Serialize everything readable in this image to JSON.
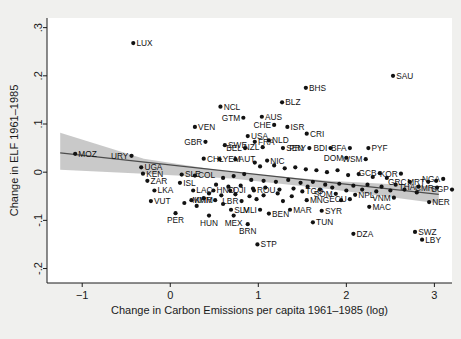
{
  "chart_data": {
    "type": "scatter",
    "title": "",
    "xlabel": "Change in Carbon Emissions per capita 1961–1985 (log)",
    "ylabel": "Change in ELF 1961–1985",
    "xlim": [
      -1.4,
      3.2
    ],
    "ylim": [
      -0.23,
      0.32
    ],
    "xticks": [
      -1,
      0,
      1,
      2,
      3
    ],
    "xticklabels": [
      "−1",
      "0",
      "1",
      "2",
      "3"
    ],
    "yticks": [
      -0.2,
      -0.1,
      0,
      0.1,
      0.2,
      0.3
    ],
    "yticklabels": [
      "-.2",
      "-.1",
      "0",
      ".1",
      ".2",
      ".3"
    ],
    "grid": false,
    "legend": null,
    "marker_color": "#121212",
    "fit_line_color": "#4d4d4d",
    "ci_band_color": "#bfbfbf",
    "fit_line": {
      "x0": -1.25,
      "y0": 0.04,
      "x1": 3.05,
      "y1": -0.046
    },
    "ci_band": {
      "upper": [
        [
          -1.25,
          0.082
        ],
        [
          -0.3,
          0.028
        ],
        [
          0.7,
          0.0
        ],
        [
          1.8,
          -0.018
        ],
        [
          3.05,
          -0.03
        ]
      ],
      "lower": [
        [
          -1.25,
          0.005
        ],
        [
          -0.3,
          -0.003
        ],
        [
          0.7,
          -0.013
        ],
        [
          1.8,
          -0.035
        ],
        [
          3.05,
          -0.065
        ]
      ]
    },
    "points": [
      {
        "label": "LUX",
        "x": -0.42,
        "y": 0.268,
        "lp": "right"
      },
      {
        "label": "SAU",
        "x": 2.53,
        "y": 0.2,
        "lp": "right"
      },
      {
        "label": "BHS",
        "x": 1.54,
        "y": 0.175,
        "lp": "right"
      },
      {
        "label": "BLZ",
        "x": 1.27,
        "y": 0.145,
        "lp": "right"
      },
      {
        "label": "NCL",
        "x": 0.57,
        "y": 0.136,
        "lp": "right"
      },
      {
        "label": "AUS",
        "x": 1.04,
        "y": 0.115,
        "lp": "right"
      },
      {
        "label": "GTM",
        "x": 0.83,
        "y": 0.113,
        "lp": "left"
      },
      {
        "label": "CHE",
        "x": 1.18,
        "y": 0.098,
        "lp": "left"
      },
      {
        "label": "ISR",
        "x": 1.33,
        "y": 0.094,
        "lp": "right"
      },
      {
        "label": "VEN",
        "x": 0.28,
        "y": 0.094,
        "lp": "right"
      },
      {
        "label": "CRI",
        "x": 1.55,
        "y": 0.08,
        "lp": "right"
      },
      {
        "label": "USA",
        "x": 0.88,
        "y": 0.075,
        "lp": "right"
      },
      {
        "label": "NLD",
        "x": 1.12,
        "y": 0.066,
        "lp": "right"
      },
      {
        "label": "GBR",
        "x": 0.4,
        "y": 0.063,
        "lp": "left"
      },
      {
        "label": "FRA",
        "x": 0.96,
        "y": 0.063,
        "lp": "right"
      },
      {
        "label": "SWE",
        "x": 0.62,
        "y": 0.056,
        "lp": "right"
      },
      {
        "label": "BEL",
        "x": 0.85,
        "y": 0.05,
        "lp": "left"
      },
      {
        "label": "NZL",
        "x": 1.05,
        "y": 0.052,
        "lp": "left"
      },
      {
        "label": "SEN",
        "x": 1.28,
        "y": 0.05,
        "lp": "right"
      },
      {
        "label": "PRY",
        "x": 1.58,
        "y": 0.05,
        "lp": "left"
      },
      {
        "label": "BDI",
        "x": 1.82,
        "y": 0.05,
        "lp": "left"
      },
      {
        "label": "BFA",
        "x": 2.04,
        "y": 0.05,
        "lp": "left"
      },
      {
        "label": "PYF",
        "x": 2.25,
        "y": 0.05,
        "lp": "right"
      },
      {
        "label": "MOZ",
        "x": -1.08,
        "y": 0.038,
        "lp": "right"
      },
      {
        "label": "URY",
        "x": -0.44,
        "y": 0.034,
        "lp": "left"
      },
      {
        "label": "CHL",
        "x": 0.38,
        "y": 0.028,
        "lp": "right"
      },
      {
        "label": "YEM",
        "x": 0.56,
        "y": 0.027,
        "lp": "right"
      },
      {
        "label": "AUT",
        "x": 0.74,
        "y": 0.027,
        "lp": "right"
      },
      {
        "label": "NIC",
        "x": 1.1,
        "y": 0.024,
        "lp": "right"
      },
      {
        "label": "DOM",
        "x": 2.0,
        "y": 0.03,
        "lp": "left"
      },
      {
        "label": "WSM",
        "x": 2.22,
        "y": 0.027,
        "lp": "left"
      },
      {
        "label": "UGA",
        "x": -0.33,
        "y": 0.01,
        "lp": "right"
      },
      {
        "label": "KEN",
        "x": -0.31,
        "y": -0.003,
        "lp": "right"
      },
      {
        "label": "SLE",
        "x": 0.13,
        "y": -0.005,
        "lp": "right"
      },
      {
        "label": "COL",
        "x": 0.28,
        "y": -0.007,
        "lp": "right"
      },
      {
        "label": "GCB",
        "x": 2.38,
        "y": -0.002,
        "lp": "left"
      },
      {
        "label": "KOR",
        "x": 2.62,
        "y": -0.003,
        "lp": "left"
      },
      {
        "label": "ZAR",
        "x": -0.26,
        "y": -0.018,
        "lp": "right"
      },
      {
        "label": "ISL",
        "x": 0.11,
        "y": -0.022,
        "lp": "right"
      },
      {
        "label": "GRC",
        "x": 2.72,
        "y": -0.02,
        "lp": "left"
      },
      {
        "label": "MRT",
        "x": 2.93,
        "y": -0.02,
        "lp": "left"
      },
      {
        "label": "NGA",
        "x": 3.1,
        "y": -0.014,
        "lp": "left"
      },
      {
        "label": "LKA",
        "x": -0.18,
        "y": -0.038,
        "lp": "right"
      },
      {
        "label": "LAC",
        "x": 0.26,
        "y": -0.038,
        "lp": "right"
      },
      {
        "label": "HND",
        "x": 0.49,
        "y": -0.038,
        "lp": "right"
      },
      {
        "label": "DJI",
        "x": 0.68,
        "y": -0.038,
        "lp": "right"
      },
      {
        "label": "ROU",
        "x": 0.95,
        "y": -0.038,
        "lp": "right"
      },
      {
        "label": "TGO",
        "x": 1.5,
        "y": -0.04,
        "lp": "right"
      },
      {
        "label": "THA",
        "x": 2.82,
        "y": -0.03,
        "lp": "left"
      },
      {
        "label": "CMR",
        "x": 3.03,
        "y": -0.032,
        "lp": "left"
      },
      {
        "label": "SGP",
        "x": 3.2,
        "y": -0.036,
        "lp": "left"
      },
      {
        "label": "SOM",
        "x": 1.88,
        "y": -0.045,
        "lp": "left"
      },
      {
        "label": "NPL",
        "x": 2.1,
        "y": -0.047,
        "lp": "right"
      },
      {
        "label": "ECU",
        "x": 2.04,
        "y": -0.056,
        "lp": "left"
      },
      {
        "label": "VNM",
        "x": 2.54,
        "y": -0.053,
        "lp": "left"
      },
      {
        "label": "VUT",
        "x": -0.22,
        "y": -0.06,
        "lp": "right"
      },
      {
        "label": "KHM",
        "x": 0.24,
        "y": -0.058,
        "lp": "right"
      },
      {
        "label": "MMR",
        "x": 0.51,
        "y": -0.058,
        "lp": "left"
      },
      {
        "label": "LBR",
        "x": 0.81,
        "y": -0.06,
        "lp": "left"
      },
      {
        "label": "MNG",
        "x": 1.55,
        "y": -0.058,
        "lp": "right"
      },
      {
        "label": "NER",
        "x": 2.94,
        "y": -0.062,
        "lp": "right"
      },
      {
        "label": "MAC",
        "x": 2.26,
        "y": -0.072,
        "lp": "right"
      },
      {
        "label": "SLV",
        "x": 0.69,
        "y": -0.078,
        "lp": "right"
      },
      {
        "label": "MLI",
        "x": 1.02,
        "y": -0.078,
        "lp": "left"
      },
      {
        "label": "MAR",
        "x": 1.36,
        "y": -0.078,
        "lp": "right"
      },
      {
        "label": "SYR",
        "x": 1.72,
        "y": -0.08,
        "lp": "right"
      },
      {
        "label": "PER",
        "x": 0.06,
        "y": -0.085,
        "lp": "below"
      },
      {
        "label": "HUN",
        "x": 0.44,
        "y": -0.09,
        "lp": "below"
      },
      {
        "label": "MEX",
        "x": 0.72,
        "y": -0.09,
        "lp": "below"
      },
      {
        "label": "BEN",
        "x": 1.12,
        "y": -0.086,
        "lp": "right"
      },
      {
        "label": "BRN",
        "x": 0.88,
        "y": -0.108,
        "lp": "below"
      },
      {
        "label": "TUN",
        "x": 1.62,
        "y": -0.104,
        "lp": "right"
      },
      {
        "label": "DZA",
        "x": 2.08,
        "y": -0.128,
        "lp": "right"
      },
      {
        "label": "SWZ",
        "x": 2.78,
        "y": -0.124,
        "lp": "right"
      },
      {
        "label": "LBY",
        "x": 2.86,
        "y": -0.14,
        "lp": "right"
      },
      {
        "label": "STP",
        "x": 0.99,
        "y": -0.15,
        "lp": "right"
      },
      {
        "label": "",
        "x": 0.96,
        "y": 0.02,
        "lp": "none"
      },
      {
        "label": "",
        "x": 1.02,
        "y": 0.012,
        "lp": "none"
      },
      {
        "label": "",
        "x": 1.18,
        "y": 0.014,
        "lp": "none"
      },
      {
        "label": "",
        "x": 1.3,
        "y": 0.008,
        "lp": "none"
      },
      {
        "label": "",
        "x": 1.42,
        "y": 0.01,
        "lp": "none"
      },
      {
        "label": "",
        "x": 1.54,
        "y": 0.006,
        "lp": "none"
      },
      {
        "label": "",
        "x": 1.66,
        "y": 0.004,
        "lp": "none"
      },
      {
        "label": "",
        "x": 1.78,
        "y": 0.0,
        "lp": "none"
      },
      {
        "label": "",
        "x": 1.9,
        "y": 0.004,
        "lp": "none"
      },
      {
        "label": "",
        "x": 2.02,
        "y": -0.006,
        "lp": "none"
      },
      {
        "label": "",
        "x": 2.14,
        "y": -0.004,
        "lp": "none"
      },
      {
        "label": "",
        "x": 2.3,
        "y": -0.01,
        "lp": "none"
      },
      {
        "label": "",
        "x": 2.46,
        "y": -0.012,
        "lp": "none"
      },
      {
        "label": "",
        "x": 0.84,
        "y": -0.004,
        "lp": "none"
      },
      {
        "label": "",
        "x": 0.72,
        "y": -0.008,
        "lp": "none"
      },
      {
        "label": "",
        "x": 0.6,
        "y": -0.012,
        "lp": "none"
      },
      {
        "label": "",
        "x": 0.92,
        "y": -0.016,
        "lp": "none"
      },
      {
        "label": "",
        "x": 1.06,
        "y": -0.018,
        "lp": "none"
      },
      {
        "label": "",
        "x": 1.2,
        "y": -0.02,
        "lp": "none"
      },
      {
        "label": "",
        "x": 1.34,
        "y": -0.016,
        "lp": "none"
      },
      {
        "label": "",
        "x": 1.48,
        "y": -0.022,
        "lp": "none"
      },
      {
        "label": "",
        "x": 1.62,
        "y": -0.02,
        "lp": "none"
      },
      {
        "label": "",
        "x": 1.76,
        "y": -0.026,
        "lp": "none"
      },
      {
        "label": "",
        "x": 1.92,
        "y": -0.024,
        "lp": "none"
      },
      {
        "label": "",
        "x": 2.08,
        "y": -0.028,
        "lp": "none"
      },
      {
        "label": "",
        "x": 2.24,
        "y": -0.026,
        "lp": "none"
      },
      {
        "label": "",
        "x": 2.4,
        "y": -0.03,
        "lp": "none"
      },
      {
        "label": "",
        "x": 2.56,
        "y": -0.026,
        "lp": "none"
      },
      {
        "label": "",
        "x": 0.52,
        "y": -0.026,
        "lp": "none"
      },
      {
        "label": "",
        "x": 0.66,
        "y": -0.03,
        "lp": "none"
      },
      {
        "label": "",
        "x": 0.8,
        "y": -0.028,
        "lp": "none"
      },
      {
        "label": "",
        "x": 0.94,
        "y": -0.034,
        "lp": "none"
      },
      {
        "label": "",
        "x": 1.08,
        "y": -0.032,
        "lp": "none"
      },
      {
        "label": "",
        "x": 1.24,
        "y": -0.036,
        "lp": "none"
      },
      {
        "label": "",
        "x": 1.4,
        "y": -0.034,
        "lp": "none"
      },
      {
        "label": "",
        "x": 1.56,
        "y": -0.03,
        "lp": "none"
      },
      {
        "label": "",
        "x": 1.7,
        "y": -0.036,
        "lp": "none"
      },
      {
        "label": "",
        "x": 1.84,
        "y": -0.032,
        "lp": "none"
      },
      {
        "label": "",
        "x": 2.0,
        "y": -0.038,
        "lp": "none"
      },
      {
        "label": "",
        "x": 2.18,
        "y": -0.036,
        "lp": "none"
      },
      {
        "label": "",
        "x": 2.34,
        "y": -0.04,
        "lp": "none"
      },
      {
        "label": "",
        "x": 2.5,
        "y": -0.038,
        "lp": "none"
      },
      {
        "label": "",
        "x": 0.44,
        "y": -0.044,
        "lp": "none"
      },
      {
        "label": "",
        "x": 0.58,
        "y": -0.048,
        "lp": "none"
      },
      {
        "label": "",
        "x": 0.74,
        "y": -0.046,
        "lp": "none"
      },
      {
        "label": "",
        "x": 0.9,
        "y": -0.05,
        "lp": "none"
      },
      {
        "label": "",
        "x": 1.06,
        "y": -0.048,
        "lp": "none"
      },
      {
        "label": "",
        "x": 1.22,
        "y": -0.044,
        "lp": "none"
      },
      {
        "label": "",
        "x": 1.38,
        "y": -0.05,
        "lp": "none"
      },
      {
        "label": "",
        "x": 2.66,
        "y": -0.036,
        "lp": "none"
      },
      {
        "label": "",
        "x": 2.8,
        "y": -0.042,
        "lp": "none"
      },
      {
        "label": "",
        "x": 3.02,
        "y": -0.018,
        "lp": "none"
      },
      {
        "label": "",
        "x": 1.94,
        "y": -0.058,
        "lp": "none"
      },
      {
        "label": "",
        "x": 1.28,
        "y": -0.06,
        "lp": "none"
      },
      {
        "label": "",
        "x": 0.38,
        "y": -0.054,
        "lp": "none"
      },
      {
        "label": "",
        "x": 0.98,
        "y": -0.056,
        "lp": "none"
      },
      {
        "label": "",
        "x": 0.16,
        "y": -0.064,
        "lp": "none"
      },
      {
        "label": "",
        "x": 0.6,
        "y": -0.066,
        "lp": "none"
      },
      {
        "label": "",
        "x": 0.3,
        "y": -0.07,
        "lp": "none"
      }
    ]
  }
}
